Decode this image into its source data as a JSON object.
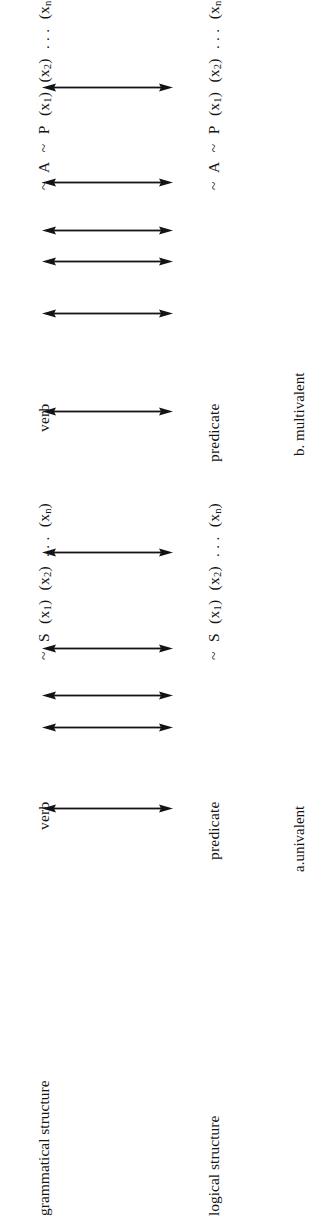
{
  "figure": {
    "background_color": "#ffffff",
    "ink_color": "#141414",
    "orientation": "rotated-90-ccw",
    "axis_labels": {
      "grammatical": "grammatical structure",
      "logical": "logical structure"
    },
    "panels": [
      {
        "id": "multivalent",
        "caption": "b. multivalent",
        "grammatical_row": {
          "lead": "verb",
          "expression_plain": "~ A ~ P (x1) (x2) . . . (xn)",
          "tokens": [
            "~",
            "A",
            "~",
            "P",
            "(x",
            "1",
            ")",
            "(x",
            "2",
            ")",
            ". . .",
            "(x",
            "n",
            ")"
          ]
        },
        "logical_row": {
          "lead": "predicate",
          "expression_plain": "~ A ~ P (x1) (x2) . . . (xn)",
          "tokens": [
            "~",
            "A",
            "~",
            "P",
            "(x",
            "1",
            ")",
            "(x",
            "2",
            ")",
            ". . .",
            "(x",
            "n",
            ")"
          ]
        },
        "correspondence_arrows": 5,
        "arrow_style": "double-headed"
      },
      {
        "id": "univalent",
        "caption": "a.univalent",
        "grammatical_row": {
          "lead": "verb",
          "expression_plain": "~ S (x1) (x2) . . . (xn)",
          "tokens": [
            "~",
            "S",
            "(x",
            "1",
            ")",
            "(x",
            "2",
            ")",
            ". . .",
            "(x",
            "n",
            ")"
          ]
        },
        "logical_row": {
          "lead": "predicate",
          "expression_plain": "~ S (x1) (x2) . . . (xn)",
          "tokens": [
            "~",
            "S",
            "(x",
            "1",
            ")",
            "(x",
            "2",
            ")",
            ". . .",
            "(x",
            "n",
            ")"
          ]
        },
        "correspondence_arrows": 5,
        "arrow_style": "double-headed"
      }
    ],
    "text": {
      "verb": "verb",
      "predicate": "predicate",
      "tilde": "~",
      "letter_A": "A",
      "letter_P": "P",
      "letter_S": "S",
      "ellipsis": ". . .",
      "x_open": "(x",
      "x_close": ")",
      "sub_1": "1",
      "sub_2": "2",
      "sub_n": "n",
      "caption_multivalent": "b. multivalent",
      "caption_univalent": "a.univalent",
      "label_grammatical": "grammatical structure",
      "label_logical": "logical structure"
    }
  }
}
